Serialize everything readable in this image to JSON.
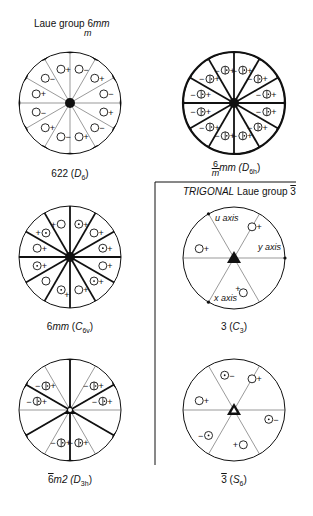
{
  "hexagonal": {
    "title": {
      "prefix": "Laue group ",
      "symbol": "6",
      "sym_tail": "mm",
      "sym_den": "m"
    },
    "diagrams": [
      {
        "id": "622",
        "label": "622",
        "schoen": "D",
        "schoen_sub": "6",
        "cx": 70,
        "cy": 103,
        "r": 51
      },
      {
        "id": "6/mmm",
        "label_num": "6",
        "label_den": "m",
        "label_tail": "mm",
        "schoen": "D",
        "schoen_sub": "6h",
        "cx": 234,
        "cy": 103,
        "r": 51
      },
      {
        "id": "6mm",
        "label": "6mm",
        "schoen": "C",
        "schoen_sub": "6v",
        "cx": 70,
        "cy": 257,
        "r": 51
      },
      {
        "id": "-6m2",
        "label": "6m2",
        "label_bar": "6",
        "schoen": "D",
        "schoen_sub": "3h",
        "cx": 70,
        "cy": 410,
        "r": 51
      }
    ]
  },
  "trigonal": {
    "title": {
      "system": "TRIGONAL",
      "prefix": " Laue group ",
      "symbol": "3"
    },
    "axes": {
      "u": "u axis",
      "y": "y axis",
      "x": "x axis"
    },
    "diagrams": [
      {
        "id": "3",
        "label": "3",
        "schoen": "C",
        "schoen_sub": "3",
        "cx": 234,
        "cy": 258,
        "r": 51
      },
      {
        "id": "-3",
        "label": "3",
        "label_bar": true,
        "schoen": "S",
        "schoen_sub": "6",
        "cx": 234,
        "cy": 410,
        "r": 51
      }
    ]
  },
  "labels": {
    "d622": "622 (",
    "d622_s": "D",
    "d622_sub": "6",
    "d6mmm_tail": "mm (",
    "d6mmm_s": "D",
    "d6mmm_sub": "6h",
    "d6mm": "6mm",
    "d6mm_s": "C",
    "d6mm_sub": "6v",
    "d6m2_bar": "6",
    "d6m2": "m2 (",
    "d6m2_s": "D",
    "d6m2_sub": "3h",
    "d3": "3 (",
    "d3_s": "C",
    "d3_sub": "3",
    "d3bar": "3",
    "d3bar_s": "S",
    "d3bar_sub": "6",
    "close": ")",
    "lg_prefix": "Laue group ",
    "lg_6": "6",
    "lg_mm": "mm",
    "lg_m": "m",
    "trig_sys": "TRIGONAL",
    "trig_lg": " Laue group ",
    "trig_3": "3",
    "u_axis": "u axis",
    "y_axis": "y axis",
    "x_axis": "x axis",
    "plus": "+",
    "minus": "−"
  },
  "colors": {
    "ink": "#111111",
    "thin": "#555555",
    "background": "#ffffff"
  }
}
